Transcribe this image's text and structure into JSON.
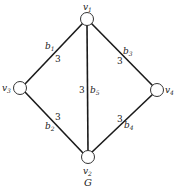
{
  "diagram": {
    "caption": "G",
    "type": "undirected weighted graph",
    "nodes": [
      {
        "id": "v1",
        "label": "v",
        "sub": "1",
        "position": "top"
      },
      {
        "id": "v2",
        "label": "v",
        "sub": "2",
        "position": "bottom"
      },
      {
        "id": "v3",
        "label": "v",
        "sub": "3",
        "position": "left"
      },
      {
        "id": "v4",
        "label": "v",
        "sub": "4",
        "position": "right"
      }
    ],
    "edges": [
      {
        "id": "b1",
        "label": "b",
        "sub": "1",
        "from": "v3",
        "to": "v1",
        "weight": "3"
      },
      {
        "id": "b2",
        "label": "b",
        "sub": "2",
        "from": "v3",
        "to": "v2",
        "weight": "3"
      },
      {
        "id": "b3",
        "label": "b",
        "sub": "3",
        "from": "v1",
        "to": "v4",
        "weight": "3"
      },
      {
        "id": "b4",
        "label": "b",
        "sub": "4",
        "from": "v2",
        "to": "v4",
        "weight": "3"
      },
      {
        "id": "b5",
        "label": "b",
        "sub": "5",
        "from": "v1",
        "to": "v2",
        "weight": "3"
      }
    ],
    "colors": {
      "stroke": "#1a1a1a",
      "node_fill": "#ffffff",
      "background": "#ffffff"
    }
  }
}
